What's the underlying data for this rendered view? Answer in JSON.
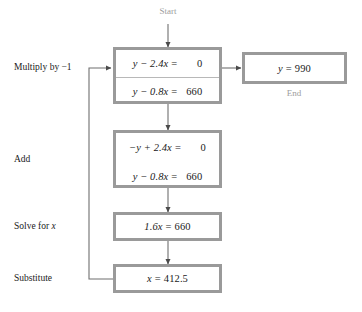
{
  "diagram": {
    "title_caption_start": "Start",
    "title_caption_end": "End",
    "accent_border": "#9a9a9a",
    "caption_color": "#9d9d9d",
    "text_color": "#1a1a1a",
    "background": "#ffffff",
    "side_labels": [
      {
        "id": "multiply",
        "text": "Multiply by −1"
      },
      {
        "id": "add",
        "text": "Add"
      },
      {
        "id": "solve",
        "text": "Solve for x"
      },
      {
        "id": "substitute",
        "text": "Substitute"
      }
    ],
    "nodes": [
      {
        "id": "system-1",
        "rows": [
          {
            "lhs": "y − 2.4x",
            "eq": "=",
            "rhs": "0",
            "divider": true
          },
          {
            "lhs": "y − 0.8x",
            "eq": "=",
            "rhs": "660",
            "divider": false
          }
        ]
      },
      {
        "id": "system-2",
        "rows": [
          {
            "lhs": "−y + 2.4x",
            "eq": "=",
            "rhs": "0",
            "divider": false
          },
          {
            "lhs": "y − 0.8x",
            "eq": "=",
            "rhs": "660",
            "divider": false
          }
        ]
      },
      {
        "id": "solved-x-equation",
        "rows": [
          {
            "lhs": "1.6x",
            "eq": "=",
            "rhs": "660",
            "divider": false
          }
        ]
      },
      {
        "id": "x-value",
        "rows": [
          {
            "lhs": "x",
            "eq": "=",
            "rhs": "412.5",
            "divider": false
          }
        ]
      },
      {
        "id": "y-value",
        "rows": [
          {
            "lhs": "y",
            "eq": "=",
            "rhs": "990",
            "divider": false
          }
        ]
      }
    ]
  }
}
